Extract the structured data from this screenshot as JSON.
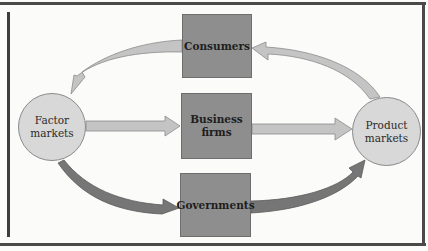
{
  "diagram": {
    "type": "circular-flow",
    "nodes": {
      "factor_markets": {
        "line1": "Factor",
        "line2": "markets",
        "shape": "circle"
      },
      "product_markets": {
        "line1": "Product",
        "line2": "markets",
        "shape": "circle"
      },
      "consumers": {
        "label": "Consumers",
        "shape": "box"
      },
      "business_firms": {
        "line1": "Business",
        "line2": "firms",
        "shape": "box"
      },
      "governments": {
        "label": "Governments",
        "shape": "box"
      }
    },
    "edges": [
      {
        "from": "Consumers",
        "to": "Factor markets",
        "style": "light"
      },
      {
        "from": "Product markets",
        "to": "Consumers",
        "style": "light"
      },
      {
        "from": "Factor markets",
        "to": "Business firms",
        "style": "light"
      },
      {
        "from": "Business firms",
        "to": "Product markets",
        "style": "light"
      },
      {
        "from": "Factor markets",
        "to": "Governments",
        "style": "dark"
      },
      {
        "from": "Governments",
        "to": "Product markets",
        "style": "dark"
      }
    ],
    "colors": {
      "box_fill": "#8e8e8e",
      "circle_fill": "#d8d8d8",
      "light_arrow": "#c4c4c4",
      "dark_arrow": "#767676",
      "frame": "#4a4a4a"
    }
  }
}
